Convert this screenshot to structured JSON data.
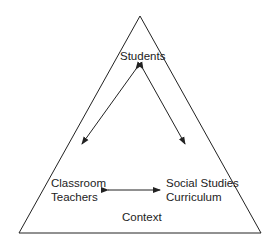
{
  "diagram": {
    "nodes": {
      "students": "Students",
      "teachers_line1": "Classroom",
      "teachers_line2": "Teachers",
      "curriculum_line1": "Social Studies",
      "curriculum_line2": "Curriculum",
      "context": "Context"
    },
    "edges": [
      {
        "from": "Students",
        "to": "Classroom Teachers",
        "type": "bidirectional"
      },
      {
        "from": "Students",
        "to": "Social Studies Curriculum",
        "type": "bidirectional"
      },
      {
        "from": "Classroom Teachers",
        "to": "Social Studies Curriculum",
        "type": "bidirectional"
      }
    ],
    "container_shape": "triangle",
    "stroke_color": "#222222"
  }
}
